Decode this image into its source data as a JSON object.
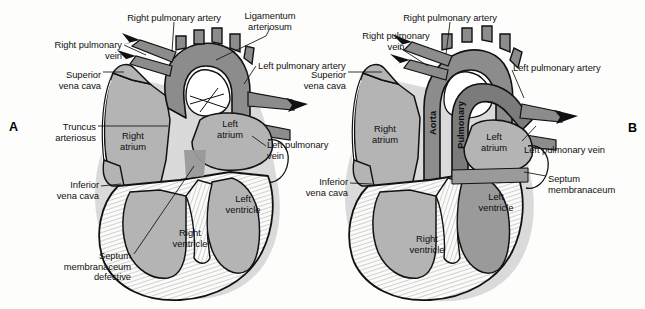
{
  "figure": {
    "background_color": "#fdfdfc",
    "panels": [
      {
        "id": "A",
        "letter": "A"
      },
      {
        "id": "B",
        "letter": "B"
      }
    ]
  },
  "colors": {
    "chamber_fill": "#b4b4b4",
    "chamber_fill_dark": "#9a9a9a",
    "vessel_fill": "#8c8c8c",
    "vessel_fill_dark": "#7b7b7b",
    "myocardium": "#fbfbfa",
    "outline": "#111111",
    "label_text": "#111111",
    "shadow": "#cfcfcf"
  },
  "panelA": {
    "letter": "A",
    "labels": [
      {
        "name": "right-pulmonary-artery",
        "text": "Right pulmonary artery",
        "x": 174,
        "y": 13,
        "align": "c"
      },
      {
        "name": "ligamentum-arteriosum",
        "text": "Ligamentum\narteriosum",
        "x": 270,
        "y": 11,
        "align": "c"
      },
      {
        "name": "right-pulmonary-vein",
        "text": "Right pulmonary\nvein",
        "x": 122,
        "y": 40,
        "align": "r"
      },
      {
        "name": "superior-vena-cava",
        "text": "Superior\nvena cava",
        "x": 101,
        "y": 70,
        "align": "r"
      },
      {
        "name": "left-pulmonary-artery",
        "text": "Left pulmonary artery",
        "x": 258,
        "y": 61,
        "align": "l"
      },
      {
        "name": "truncus-arteriosus",
        "text": "Truncus\narteriosus",
        "x": 96,
        "y": 122,
        "align": "r"
      },
      {
        "name": "left-pulmonary-vein",
        "text": "Left pulmonary\nvein",
        "x": 267,
        "y": 140,
        "align": "l"
      },
      {
        "name": "inferior-vena-cava",
        "text": "Inferior\nvena cava",
        "x": 99,
        "y": 180,
        "align": "r"
      },
      {
        "name": "septum-membranaceum-defective",
        "text": "Septum\nmembranaceum\ndefective",
        "x": 131,
        "y": 251,
        "align": "r"
      }
    ],
    "chambers": [
      {
        "name": "right-atrium",
        "text": "Right\natrium",
        "x": 133,
        "y": 131
      },
      {
        "name": "left-atrium",
        "text": "Left\natrium",
        "x": 230,
        "y": 119
      },
      {
        "name": "left-ventricle",
        "text": "Left\nventricle",
        "x": 243,
        "y": 194
      },
      {
        "name": "right-ventricle",
        "text": "Right\nventricle",
        "x": 190,
        "y": 228
      }
    ],
    "vessel_names": []
  },
  "panelB": {
    "letter": "B",
    "labels": [
      {
        "name": "right-pulmonary-artery",
        "text": "Right pulmonary artery",
        "x": 450,
        "y": 13,
        "align": "c"
      },
      {
        "name": "right-pulmonary-vein",
        "text": "Right pulmonary\nvein",
        "x": 396,
        "y": 31,
        "align": "c"
      },
      {
        "name": "superior-vena-cava",
        "text": "Superior\nvena cava",
        "x": 346,
        "y": 70,
        "align": "r"
      },
      {
        "name": "left-pulmonary-artery",
        "text": "Left pulmonary artery",
        "x": 513,
        "y": 63,
        "align": "l"
      },
      {
        "name": "left-pulmonary-vein",
        "text": "Left pulmonary vein",
        "x": 524,
        "y": 145,
        "align": "l"
      },
      {
        "name": "inferior-vena-cava",
        "text": "Inferior\nvena cava",
        "x": 348,
        "y": 177,
        "align": "r"
      },
      {
        "name": "septum-membranaceum",
        "text": "Septum\nmembranaceum",
        "x": 548,
        "y": 174,
        "align": "l"
      }
    ],
    "chambers": [
      {
        "name": "right-atrium",
        "text": "Right\natrium",
        "x": 385,
        "y": 124
      },
      {
        "name": "left-atrium",
        "text": "Left\natrium",
        "x": 494,
        "y": 132
      },
      {
        "name": "left-ventricle",
        "text": "Left\nventricle",
        "x": 496,
        "y": 192
      },
      {
        "name": "right-ventricle",
        "text": "Right\nventricle",
        "x": 427,
        "y": 234
      }
    ],
    "vessel_names": [
      {
        "name": "aorta",
        "text": "Aorta",
        "x": 433,
        "y": 123,
        "rotation": -90
      },
      {
        "name": "pulmonary-trunk",
        "text": "Pulmonary",
        "x": 461,
        "y": 125,
        "rotation": -90
      }
    ]
  }
}
